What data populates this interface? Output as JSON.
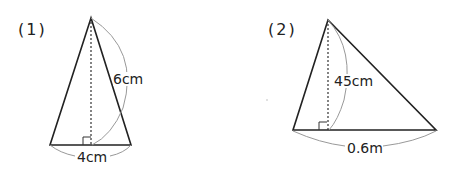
{
  "figures": [
    {
      "number_label": "(1)",
      "side_label": "6cm",
      "base_label": "4cm",
      "shape": "isosceles triangle",
      "measurements": {
        "slant_side": "6cm",
        "base": "4cm"
      }
    },
    {
      "number_label": "(2)",
      "height_label": "45cm",
      "base_label": "0.6m",
      "shape": "scalene triangle",
      "measurements": {
        "height": "45cm",
        "base": "0.6m"
      }
    }
  ],
  "colors": {
    "stroke": "#222222",
    "arc": "#999999",
    "text": "#222222"
  }
}
